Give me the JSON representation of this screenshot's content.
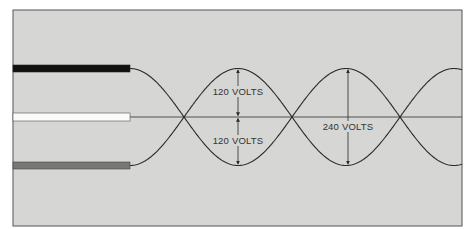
{
  "diagram": {
    "title": "",
    "background_color": "#d6d6d4",
    "frame_color": "#555555",
    "wires": [
      {
        "name": "hot-wire-black",
        "color": "#111111",
        "y": 68.5
      },
      {
        "name": "neutral-wire-white",
        "color": "#fbfbfb",
        "y": 117
      },
      {
        "name": "hot-wire-red-gray",
        "color": "#777777",
        "y": 165.5
      }
    ],
    "labels": {
      "upper_half": "120 VOLTS",
      "lower_half": "120 VOLTS",
      "full": "240 VOLTS"
    },
    "wave": {
      "start_x": 130,
      "end_x": 462,
      "center_y": 117,
      "amplitude": 48.5,
      "half_period": 108,
      "stroke": "#2a2a2a"
    },
    "measurements": [
      {
        "x": 238,
        "type": "split",
        "top_label": "120 VOLTS",
        "bottom_label": "120 VOLTS"
      },
      {
        "x": 348,
        "type": "full",
        "label": "240 VOLTS"
      }
    ]
  }
}
